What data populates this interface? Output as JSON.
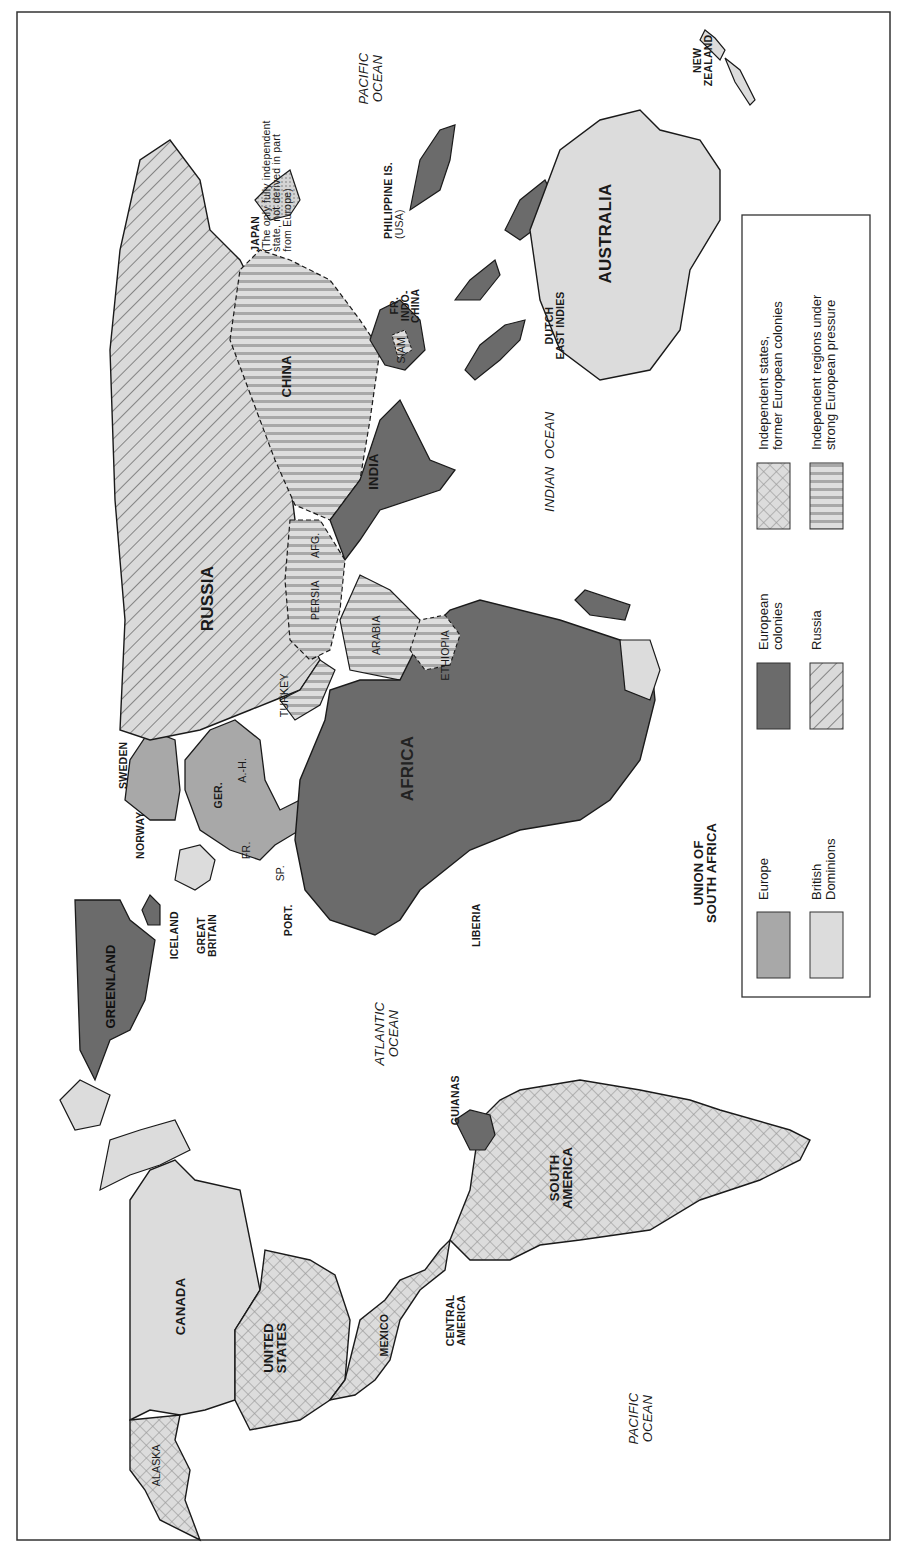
{
  "map": {
    "orientation": "rotated 90 degrees counter-clockwise (north points left)",
    "regions": {
      "north_america": [
        "CANADA",
        "UNITED STATES",
        "ALASKA",
        "MEXICO",
        "CENTRAL AMERICA"
      ],
      "south_america": [
        "SOUTH AMERICA",
        "GUIANAS"
      ],
      "europe": [
        "NORWAY",
        "SWEDEN",
        "GREAT BRITAIN",
        "ICELAND",
        "GER.",
        "A.-H.",
        "FR.",
        "SP.",
        "PORT."
      ],
      "asia": [
        "RUSSIA",
        "CHINA",
        "INDIA",
        "TURKEY",
        "PERSIA",
        "AFG.",
        "ARABIA",
        "SIAM",
        "FR. INDO-CHINA",
        "JAPAN",
        "PHILIPPINE IS. (USA)",
        "DUTCH EAST INDIES"
      ],
      "africa": [
        "AFRICA",
        "ETHIOPIA",
        "LIBERIA",
        "UNION OF SOUTH AFRICA"
      ],
      "oceania": [
        "AUSTRALIA",
        "NEW ZEALAND"
      ],
      "other": [
        "GREENLAND"
      ]
    },
    "labels": {
      "canada": "CANADA",
      "united_states_1": "UNITED",
      "united_states_2": "STATES",
      "alaska": "ALASKA",
      "mexico": "MEXICO",
      "central_america_1": "CENTRAL",
      "central_america_2": "AMERICA",
      "south_america_1": "SOUTH",
      "south_america_2": "AMERICA",
      "guianas": "GUIANAS",
      "greenland": "GREENLAND",
      "iceland": "ICELAND",
      "great_britain_1": "GREAT",
      "great_britain_2": "BRITAIN",
      "norway": "NORWAY",
      "sweden": "SWEDEN",
      "germany": "GER.",
      "austria_hungary": "A.-H.",
      "france": "FR.",
      "spain": "SP.",
      "portugal": "PORT.",
      "russia": "RUSSIA",
      "turkey": "TURKEY",
      "persia": "PERSIA",
      "afghanistan": "AFG.",
      "arabia": "ARABIA",
      "ethiopia": "ETHIOPIA",
      "africa": "AFRICA",
      "liberia": "LIBERIA",
      "south_africa_1": "UNION OF",
      "south_africa_2": "SOUTH AFRICA",
      "india": "INDIA",
      "china": "CHINA",
      "siam": "SIAM",
      "indochina_1": "FR.",
      "indochina_2": "INDO-",
      "indochina_3": "CHINA",
      "japan": "JAPAN",
      "japan_note_1": "(The only fully independent",
      "japan_note_2": "state, not derived in part",
      "japan_note_3": "from Europe)",
      "philippines_1": "PHILIPPINE IS.",
      "philippines_2": "(USA)",
      "dutch_east_indies_1": "DUTCH",
      "dutch_east_indies_2": "EAST INDIES",
      "australia": "AUSTRALIA",
      "new_zealand_1": "NEW",
      "new_zealand_2": "ZEALAND"
    },
    "oceans": {
      "pacific_east_1": "PACIFIC",
      "pacific_east_2": "OCEAN",
      "pacific_west_1": "PACIFIC",
      "pacific_west_2": "OCEAN",
      "atlantic_1": "ATLANTIC",
      "atlantic_2": "OCEAN",
      "indian": "INDIAN  OCEAN"
    }
  },
  "legend": {
    "items": [
      {
        "key": "europe",
        "label": "Europe",
        "pattern": "solid-medium-gray",
        "color": "#a9a9a9"
      },
      {
        "key": "british_dominions",
        "label_1": "British",
        "label_2": "Dominions",
        "pattern": "solid-light-gray",
        "color": "#dcdcdc"
      },
      {
        "key": "european_colonies",
        "label_1": "European",
        "label_2": "colonies",
        "pattern": "solid-dark-gray",
        "color": "#6e6e6e"
      },
      {
        "key": "russia",
        "label": "Russia",
        "pattern": "diagonal-hatch",
        "color": "#d9d9d9"
      },
      {
        "key": "former_colonies",
        "label_1": "Independent states,",
        "label_2": "former European colonies",
        "pattern": "crosshatch",
        "color": "#d9d9d9"
      },
      {
        "key": "pressure",
        "label_1": "Independent regions under",
        "label_2": "strong European pressure",
        "pattern": "vertical-stripes",
        "color": "#d9d9d9"
      }
    ]
  },
  "colors": {
    "europe": "#a8a8a8",
    "dominions": "#dcdcdc",
    "colonies": "#6b6b6b",
    "hatch_bg": "#dadada",
    "hatch_line": "#7a7a7a",
    "stripe_line": "#a0a0a0",
    "outline": "#1a1a1a",
    "japan_dots": "#c8c8c8"
  }
}
